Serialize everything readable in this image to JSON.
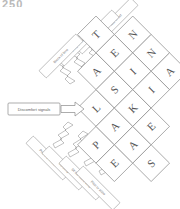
{
  "header": {
    "text": "250"
  },
  "callout": {
    "label": "Discomfort signals",
    "icon": "block-arrow-right-icon"
  },
  "grid": {
    "title": "diagonal letter grid",
    "rotation_deg": -45,
    "cells": [
      {
        "letter": "T",
        "col": 3,
        "row": 0
      },
      {
        "letter": "A",
        "col": 2,
        "row": 1
      },
      {
        "letter": "E",
        "col": 3,
        "row": 1
      },
      {
        "letter": "N",
        "col": 4,
        "row": 1
      },
      {
        "letter": "L",
        "col": 1,
        "row": 2
      },
      {
        "letter": "S",
        "col": 2,
        "row": 2
      },
      {
        "letter": "N",
        "col": 4,
        "row": 2
      },
      {
        "letter": "P",
        "col": 0,
        "row": 3
      },
      {
        "letter": "A",
        "col": 1,
        "row": 3
      },
      {
        "letter": "I",
        "col": 3,
        "row": 2
      },
      {
        "letter": "A",
        "col": 4,
        "row": 3
      },
      {
        "letter": "E",
        "col": 0,
        "row": 4
      },
      {
        "letter": "K",
        "col": 2,
        "row": 3
      },
      {
        "letter": "I",
        "col": 3,
        "row": 3
      },
      {
        "letter": "A",
        "col": 1,
        "row": 4
      },
      {
        "letter": "E",
        "col": 2,
        "row": 4
      },
      {
        "letter": "S",
        "col": 1,
        "row": 5
      }
    ],
    "words": [
      "PLEASANT",
      "TAKES",
      "PEAS",
      "TENNIS",
      "PAIN"
    ]
  },
  "clues": {
    "top": [
      {
        "id": "clue-top-1",
        "text": "Not or not"
      },
      {
        "id": "clue-top-2",
        "text": "Bite"
      },
      {
        "id": "clue-top-3",
        "text": "Body of water"
      },
      {
        "id": "clue-top-4",
        "text": "Block of time"
      }
    ],
    "bottom": [
      {
        "id": "clue-bottom-1",
        "text": "Property values"
      },
      {
        "id": "clue-bottom-2",
        "text": "Similarity"
      },
      {
        "id": "clue-bottom-3",
        "text": "Of the same kind"
      },
      {
        "id": "clue-bottom-4",
        "text": "Pain or ache"
      }
    ]
  },
  "connectors": {
    "style": "lightning-bolt-arrow",
    "count": 8
  },
  "colors": {
    "ink": "#6e6e6e",
    "stroke": "#8c8c8c",
    "background": "#ffffff",
    "header": "#b9b9b9"
  }
}
